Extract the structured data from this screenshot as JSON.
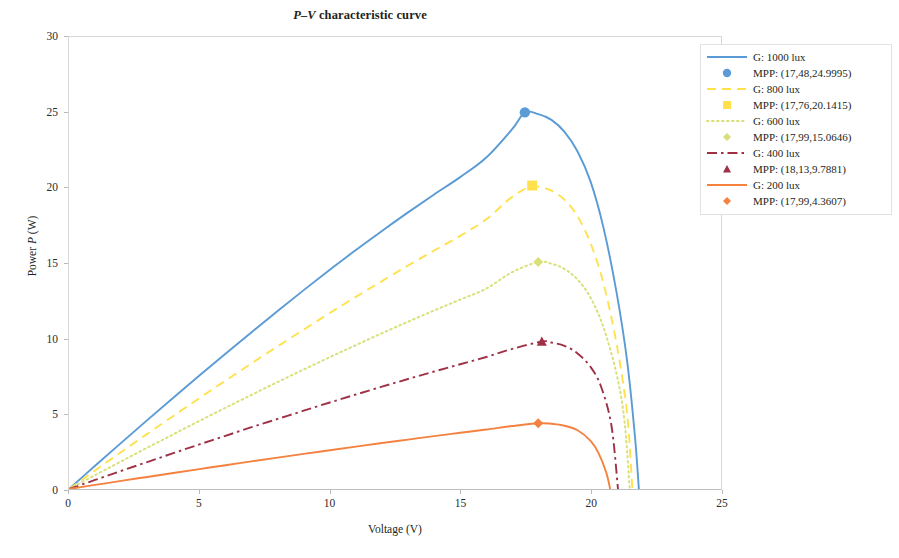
{
  "chart_data": {
    "type": "line",
    "title": "P–V characteristic curve",
    "title_parts": {
      "italic": "P–V",
      "rest": " characteristic curve"
    },
    "xlabel": "Voltage (V)",
    "ylabel_parts": {
      "pre": "Power ",
      "italic": "P",
      "post": " (W)"
    },
    "ylabel": "Power P (W)",
    "xlim": [
      0,
      25
    ],
    "ylim": [
      0,
      30
    ],
    "xticks": [
      "0",
      "5",
      "10",
      "15",
      "20",
      "25"
    ],
    "yticks": [
      "0",
      "5",
      "10",
      "15",
      "20",
      "25",
      "30"
    ],
    "grid": false,
    "legend_position": "top-right",
    "series": [
      {
        "name": "G: 1000 lux",
        "irradiance_lux": 1000,
        "color": "#5b9bd5",
        "style": "solid",
        "marker": "circle",
        "mpp_label": "MPP: (17,48,24.9995)",
        "mpp_voltage": 17.48,
        "mpp_power": 24.9995,
        "open_circuit_voltage": 21.8,
        "points": [
          [
            0,
            0
          ],
          [
            1,
            1.54
          ],
          [
            2,
            3.06
          ],
          [
            3,
            4.57
          ],
          [
            4,
            6.06
          ],
          [
            5,
            7.53
          ],
          [
            6,
            8.98
          ],
          [
            7,
            10.41
          ],
          [
            8,
            11.82
          ],
          [
            9,
            13.2
          ],
          [
            10,
            14.55
          ],
          [
            11,
            15.86
          ],
          [
            12,
            17.13
          ],
          [
            13,
            18.36
          ],
          [
            14,
            19.55
          ],
          [
            15,
            20.7
          ],
          [
            16,
            22.0
          ],
          [
            17,
            23.9
          ],
          [
            17.48,
            24.9995
          ],
          [
            18,
            24.88
          ],
          [
            18.5,
            24.5
          ],
          [
            19,
            23.7
          ],
          [
            19.5,
            22.4
          ],
          [
            20,
            20.4
          ],
          [
            20.5,
            17.3
          ],
          [
            21,
            13.0
          ],
          [
            21.4,
            8.5
          ],
          [
            21.7,
            3.5
          ],
          [
            21.85,
            0
          ]
        ]
      },
      {
        "name": "G: 800 lux",
        "irradiance_lux": 800,
        "color": "#ffe14d",
        "style": "dashed",
        "marker": "square",
        "mpp_label": "MPP: (17,76,20.1415)",
        "mpp_voltage": 17.76,
        "mpp_power": 20.1415,
        "open_circuit_voltage": 21.6,
        "points": [
          [
            0,
            0
          ],
          [
            1,
            1.23
          ],
          [
            2,
            2.45
          ],
          [
            3,
            3.66
          ],
          [
            4,
            4.85
          ],
          [
            5,
            6.03
          ],
          [
            6,
            7.19
          ],
          [
            7,
            8.34
          ],
          [
            8,
            9.47
          ],
          [
            9,
            10.58
          ],
          [
            10,
            11.68
          ],
          [
            11,
            12.75
          ],
          [
            12,
            13.8
          ],
          [
            13,
            14.83
          ],
          [
            14,
            15.83
          ],
          [
            15,
            16.8
          ],
          [
            16,
            17.9
          ],
          [
            17,
            19.4
          ],
          [
            17.76,
            20.1415
          ],
          [
            18,
            20.05
          ],
          [
            18.5,
            19.8
          ],
          [
            19,
            19.2
          ],
          [
            19.5,
            18.1
          ],
          [
            20,
            16.3
          ],
          [
            20.5,
            13.6
          ],
          [
            21,
            9.6
          ],
          [
            21.4,
            5.0
          ],
          [
            21.6,
            0
          ]
        ]
      },
      {
        "name": "G: 600 lux",
        "irradiance_lux": 600,
        "color": "#d9e07a",
        "style": "dotted",
        "marker": "diamond",
        "mpp_label": "MPP: (17,99,15.0646)",
        "mpp_voltage": 17.99,
        "mpp_power": 15.0646,
        "open_circuit_voltage": 21.4,
        "points": [
          [
            0,
            0
          ],
          [
            1,
            0.92
          ],
          [
            2,
            1.83
          ],
          [
            3,
            2.74
          ],
          [
            4,
            3.63
          ],
          [
            5,
            4.52
          ],
          [
            6,
            5.39
          ],
          [
            7,
            6.25
          ],
          [
            8,
            7.1
          ],
          [
            9,
            7.93
          ],
          [
            10,
            8.75
          ],
          [
            11,
            9.55
          ],
          [
            12,
            10.34
          ],
          [
            13,
            11.1
          ],
          [
            14,
            11.85
          ],
          [
            15,
            12.57
          ],
          [
            16,
            13.3
          ],
          [
            17,
            14.4
          ],
          [
            17.99,
            15.0646
          ],
          [
            18.5,
            14.95
          ],
          [
            19,
            14.6
          ],
          [
            19.5,
            13.9
          ],
          [
            20,
            12.7
          ],
          [
            20.5,
            10.7
          ],
          [
            21,
            7.6
          ],
          [
            21.3,
            4.5
          ],
          [
            21.5,
            0
          ]
        ]
      },
      {
        "name": "G: 400 lux",
        "irradiance_lux": 400,
        "color": "#9e3146",
        "style": "dashdot",
        "marker": "triangle",
        "mpp_label": "MPP: (18,13,9.7881)",
        "mpp_voltage": 18.13,
        "mpp_power": 9.7881,
        "open_circuit_voltage": 21.0,
        "points": [
          [
            0,
            0
          ],
          [
            1,
            0.6
          ],
          [
            2,
            1.2
          ],
          [
            3,
            1.79
          ],
          [
            4,
            2.38
          ],
          [
            5,
            2.96
          ],
          [
            6,
            3.53
          ],
          [
            7,
            4.1
          ],
          [
            8,
            4.65
          ],
          [
            9,
            5.2
          ],
          [
            10,
            5.74
          ],
          [
            11,
            6.27
          ],
          [
            12,
            6.79
          ],
          [
            13,
            7.3
          ],
          [
            14,
            7.8
          ],
          [
            15,
            8.28
          ],
          [
            16,
            8.76
          ],
          [
            17,
            9.3
          ],
          [
            18.13,
            9.7881
          ],
          [
            18.5,
            9.72
          ],
          [
            19,
            9.5
          ],
          [
            19.5,
            9.0
          ],
          [
            20,
            8.1
          ],
          [
            20.4,
            6.8
          ],
          [
            20.8,
            4.2
          ],
          [
            21.05,
            0
          ]
        ]
      },
      {
        "name": "G: 200 lux",
        "irradiance_lux": 200,
        "color": "#f4813f",
        "style": "solid",
        "marker": "diamond",
        "mpp_label": "MPP: (17,99,4.3607)",
        "mpp_voltage": 17.99,
        "mpp_power": 4.3607,
        "open_circuit_voltage": 20.7,
        "points": [
          [
            0,
            0
          ],
          [
            1,
            0.27
          ],
          [
            2,
            0.54
          ],
          [
            3,
            0.8
          ],
          [
            4,
            1.06
          ],
          [
            5,
            1.32
          ],
          [
            6,
            1.58
          ],
          [
            7,
            1.83
          ],
          [
            8,
            2.08
          ],
          [
            9,
            2.33
          ],
          [
            10,
            2.57
          ],
          [
            11,
            2.81
          ],
          [
            12,
            3.05
          ],
          [
            13,
            3.28
          ],
          [
            14,
            3.51
          ],
          [
            15,
            3.73
          ],
          [
            16,
            3.95
          ],
          [
            17,
            4.18
          ],
          [
            17.99,
            4.3607
          ],
          [
            18.5,
            4.33
          ],
          [
            19,
            4.2
          ],
          [
            19.5,
            3.9
          ],
          [
            20,
            3.2
          ],
          [
            20.3,
            2.4
          ],
          [
            20.6,
            1.1
          ],
          [
            20.75,
            0
          ]
        ]
      }
    ]
  }
}
